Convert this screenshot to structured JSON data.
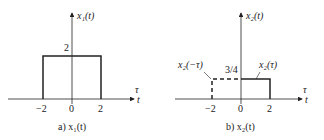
{
  "panels": [
    {
      "id": "a",
      "y_label": "x₁(t)",
      "x_label_top": "τ",
      "x_label_bottom": "t",
      "level_label": "2",
      "ticks": [
        "−2",
        "0",
        "2"
      ],
      "caption": "a) x₁(t)",
      "pulse": {
        "from": -2,
        "to": 2,
        "height": 2,
        "style": "solid"
      }
    },
    {
      "id": "b",
      "y_label": "x₂(t)",
      "x_label_top": "τ",
      "x_label_bottom": "t",
      "level_label": "3/4",
      "ticks": [
        "−2",
        "0",
        "2"
      ],
      "caption": "b) x₂(t)",
      "annotation_left": "x₂(−τ)",
      "annotation_right": "x₂(τ)",
      "pulse_right": {
        "from": 0,
        "to": 2,
        "height": 0.75,
        "style": "solid"
      },
      "pulse_left": {
        "from": -2,
        "to": 0,
        "height": 0.75,
        "style": "dashed"
      }
    }
  ]
}
